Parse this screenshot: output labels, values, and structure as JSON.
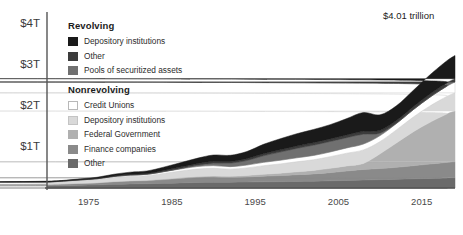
{
  "annotation": {
    "text": "$4.01 trillion",
    "x": 383,
    "y": 10
  },
  "axes": {
    "y_ticks": [
      "$1T",
      "$2T",
      "$3T",
      "$4T"
    ],
    "x_ticks": [
      "1975",
      "1985",
      "1995",
      "2005",
      "2015"
    ]
  },
  "legend": {
    "groups": [
      {
        "title": "Revolving",
        "items": [
          {
            "label": "Depository institutions",
            "color": "#1a1a1a",
            "border": "#1a1a1a"
          },
          {
            "label": "Other",
            "color": "#3c3c3c",
            "border": "#3c3c3c"
          },
          {
            "label": "Pools of securitized assets",
            "color": "#707070",
            "border": "#707070"
          }
        ]
      },
      {
        "title": "Nonrevolving",
        "items": [
          {
            "label": "Credit Unions",
            "color": "#ffffff",
            "border": "#b8b8b8"
          },
          {
            "label": "Depository institutions",
            "color": "#d9d9d9",
            "border": "#c4c4c4"
          },
          {
            "label": "Federal Government",
            "color": "#b0b0b0",
            "border": "#b0b0b0"
          },
          {
            "label": "Finance companies",
            "color": "#8a8a8a",
            "border": "#8a8a8a"
          },
          {
            "label": "Other",
            "color": "#6a6a6a",
            "border": "#6a6a6a"
          }
        ]
      }
    ]
  },
  "chart_data": {
    "type": "area",
    "stacked": true,
    "title": "",
    "xlabel": "",
    "ylabel": "",
    "xlim": [
      1970,
      2019
    ],
    "ylim": [
      0,
      4.3
    ],
    "y_unit": "trillions of USD",
    "grid": false,
    "legend_position": "inside-top-left",
    "total_latest": 4.01,
    "x": [
      1970,
      1972,
      1974,
      1976,
      1978,
      1980,
      1982,
      1984,
      1986,
      1988,
      1990,
      1992,
      1994,
      1996,
      1998,
      2000,
      2002,
      2004,
      2006,
      2008,
      2010,
      2012,
      2014,
      2016,
      2018,
      2019
    ],
    "series": [
      {
        "name": "Other",
        "group": "Nonrevolving",
        "color": "#6a6a6a",
        "values": [
          0.055,
          0.062,
          0.07,
          0.075,
          0.09,
          0.1,
          0.105,
          0.115,
          0.125,
          0.135,
          0.14,
          0.14,
          0.145,
          0.15,
          0.155,
          0.16,
          0.165,
          0.175,
          0.185,
          0.195,
          0.205,
          0.215,
          0.225,
          0.235,
          0.245,
          0.25
        ]
      },
      {
        "name": "Finance companies",
        "group": "Nonrevolving",
        "color": "#8a8a8a",
        "values": [
          0.03,
          0.036,
          0.042,
          0.05,
          0.062,
          0.07,
          0.075,
          0.09,
          0.11,
          0.125,
          0.13,
          0.12,
          0.125,
          0.14,
          0.15,
          0.165,
          0.18,
          0.2,
          0.23,
          0.26,
          0.27,
          0.29,
          0.32,
          0.35,
          0.38,
          0.39
        ]
      },
      {
        "name": "Federal Government",
        "group": "Nonrevolving",
        "color": "#b0b0b0",
        "values": [
          0.002,
          0.003,
          0.004,
          0.005,
          0.007,
          0.01,
          0.012,
          0.015,
          0.018,
          0.022,
          0.026,
          0.03,
          0.036,
          0.045,
          0.058,
          0.07,
          0.085,
          0.105,
          0.125,
          0.145,
          0.36,
          0.6,
          0.83,
          1.02,
          1.18,
          1.24
        ]
      },
      {
        "name": "Depository institutions",
        "group": "Nonrevolving",
        "color": "#d9d9d9",
        "values": [
          0.045,
          0.055,
          0.065,
          0.075,
          0.095,
          0.105,
          0.11,
          0.135,
          0.16,
          0.18,
          0.185,
          0.17,
          0.185,
          0.21,
          0.225,
          0.245,
          0.26,
          0.285,
          0.31,
          0.33,
          0.3,
          0.32,
          0.36,
          0.4,
          0.43,
          0.445
        ]
      },
      {
        "name": "Credit Unions",
        "group": "Nonrevolving",
        "color": "#ffffff",
        "values": [
          0.01,
          0.013,
          0.016,
          0.02,
          0.026,
          0.03,
          0.032,
          0.042,
          0.052,
          0.062,
          0.066,
          0.062,
          0.07,
          0.082,
          0.09,
          0.098,
          0.105,
          0.115,
          0.13,
          0.145,
          0.145,
          0.155,
          0.18,
          0.215,
          0.25,
          0.265
        ]
      },
      {
        "name": "Pools of securitized assets",
        "group": "Revolving",
        "color": "#707070",
        "values": [
          0.0,
          0.0,
          0.0,
          0.0,
          0.0,
          0.0,
          0.001,
          0.004,
          0.012,
          0.03,
          0.06,
          0.085,
          0.11,
          0.16,
          0.2,
          0.23,
          0.25,
          0.255,
          0.25,
          0.24,
          0.06,
          0.008,
          0.002,
          0.001,
          0.0,
          0.0
        ]
      },
      {
        "name": "Other",
        "group": "Revolving",
        "color": "#3c3c3c",
        "values": [
          0.004,
          0.006,
          0.008,
          0.011,
          0.015,
          0.02,
          0.022,
          0.028,
          0.034,
          0.04,
          0.044,
          0.042,
          0.045,
          0.05,
          0.054,
          0.058,
          0.06,
          0.062,
          0.066,
          0.07,
          0.068,
          0.066,
          0.07,
          0.075,
          0.08,
          0.082
        ]
      },
      {
        "name": "Depository institutions",
        "group": "Revolving",
        "color": "#1a1a1a",
        "values": [
          0.008,
          0.012,
          0.018,
          0.026,
          0.04,
          0.052,
          0.058,
          0.08,
          0.105,
          0.13,
          0.155,
          0.15,
          0.175,
          0.23,
          0.27,
          0.3,
          0.325,
          0.35,
          0.4,
          0.46,
          0.38,
          0.36,
          0.4,
          0.47,
          0.54,
          0.565
        ]
      }
    ]
  }
}
